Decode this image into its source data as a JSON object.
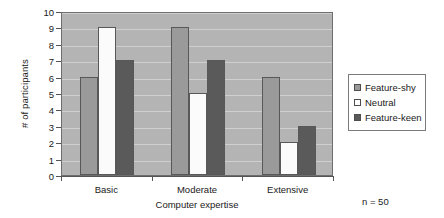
{
  "chart_data": {
    "type": "bar",
    "title": "",
    "xlabel": "Computer expertise",
    "ylabel": "# of participants",
    "categories": [
      "Basic",
      "Moderate",
      "Extensive"
    ],
    "series": [
      {
        "name": "Feature-shy",
        "color": "#9a9a9a",
        "values": [
          6,
          9,
          6
        ]
      },
      {
        "name": "Neutral",
        "color": "#ffffff",
        "values": [
          9,
          5,
          2
        ]
      },
      {
        "name": "Feature-keen",
        "color": "#5a5a5a",
        "values": [
          7,
          7,
          3
        ]
      }
    ],
    "ylim": [
      0,
      10
    ],
    "ytick_step": 1,
    "yticks": [
      "10",
      "9",
      "8",
      "7",
      "6",
      "5",
      "4",
      "3",
      "2",
      "1",
      "0"
    ],
    "grid": true,
    "legend_position": "right",
    "annotation": "n = 50",
    "plot_background": "#b4b4b4",
    "gridline_color": "#cfcfcf"
  },
  "legend": {
    "items": [
      {
        "label": "Feature-shy"
      },
      {
        "label": "Neutral"
      },
      {
        "label": "Feature-keen"
      }
    ]
  },
  "footnote": {
    "sample_size": "n = 50"
  }
}
